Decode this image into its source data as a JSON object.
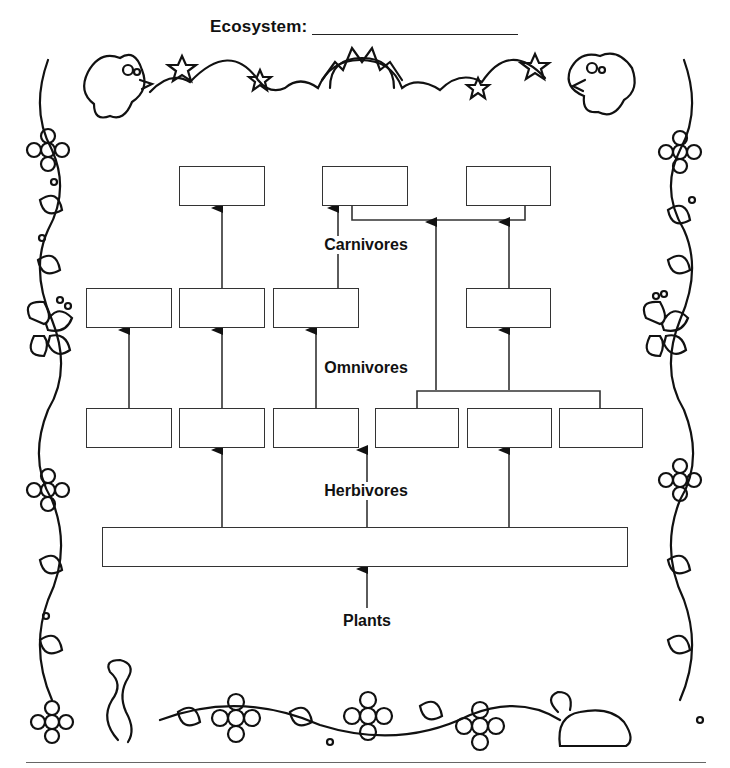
{
  "worksheet": {
    "title": "Ecosystem:",
    "title_blank": "",
    "trophic_labels": {
      "carnivores": "Carnivores",
      "omnivores": "Omnivores",
      "herbivores": "Herbivores",
      "plants": "Plants"
    }
  },
  "diagram": {
    "type": "food-web",
    "levels": [
      {
        "name": "Carnivores",
        "box_count": 3
      },
      {
        "name": "Omnivores",
        "box_count": 4
      },
      {
        "name": "Herbivores",
        "box_count": 6
      },
      {
        "name": "Plants",
        "box_count": 1
      }
    ],
    "boxes": [
      {
        "id": "c1",
        "level": "carnivores",
        "x": 179,
        "y": 166,
        "w": 86,
        "h": 40,
        "value": ""
      },
      {
        "id": "c2",
        "level": "carnivores",
        "x": 322,
        "y": 166,
        "w": 86,
        "h": 40,
        "value": ""
      },
      {
        "id": "c3",
        "level": "carnivores",
        "x": 466,
        "y": 166,
        "w": 85,
        "h": 40,
        "value": ""
      },
      {
        "id": "o1",
        "level": "omnivores",
        "x": 86,
        "y": 288,
        "w": 86,
        "h": 40,
        "value": ""
      },
      {
        "id": "o2",
        "level": "omnivores",
        "x": 179,
        "y": 288,
        "w": 86,
        "h": 40,
        "value": ""
      },
      {
        "id": "o3",
        "level": "omnivores",
        "x": 273,
        "y": 288,
        "w": 86,
        "h": 40,
        "value": ""
      },
      {
        "id": "o4",
        "level": "omnivores",
        "x": 466,
        "y": 288,
        "w": 85,
        "h": 40,
        "value": ""
      },
      {
        "id": "h1",
        "level": "herbivores",
        "x": 86,
        "y": 408,
        "w": 86,
        "h": 40,
        "value": ""
      },
      {
        "id": "h2",
        "level": "herbivores",
        "x": 179,
        "y": 408,
        "w": 86,
        "h": 40,
        "value": ""
      },
      {
        "id": "h3",
        "level": "herbivores",
        "x": 273,
        "y": 408,
        "w": 86,
        "h": 40,
        "value": ""
      },
      {
        "id": "h4",
        "level": "herbivores",
        "x": 375,
        "y": 408,
        "w": 84,
        "h": 40,
        "value": ""
      },
      {
        "id": "h5",
        "level": "herbivores",
        "x": 467,
        "y": 408,
        "w": 85,
        "h": 40,
        "value": ""
      },
      {
        "id": "h6",
        "level": "herbivores",
        "x": 559,
        "y": 408,
        "w": 84,
        "h": 40,
        "value": ""
      },
      {
        "id": "p1",
        "level": "plants",
        "x": 102,
        "y": 527,
        "w": 526,
        "h": 40,
        "value": ""
      }
    ],
    "edges": [
      {
        "from": "o2",
        "to": "c1"
      },
      {
        "from": "o3",
        "to": "c2"
      },
      {
        "from": "h4+h6",
        "to": "c2+c3"
      },
      {
        "from": "o4",
        "to": "c3"
      },
      {
        "from": "h1",
        "to": "o1"
      },
      {
        "from": "h2",
        "to": "o2"
      },
      {
        "from": "h3",
        "to": "o3"
      },
      {
        "from": "h4+h6",
        "to": "o4"
      },
      {
        "from": "p1",
        "to": "h2"
      },
      {
        "from": "p1",
        "to": "h3/h4"
      },
      {
        "from": "p1",
        "to": "h5"
      },
      {
        "from": "plants-label",
        "to": "p1"
      }
    ],
    "colors": {
      "line": "#333333",
      "text": "#111111",
      "background": "#ffffff"
    }
  },
  "border": {
    "style": "cartoon",
    "icons": [
      "bird-icon",
      "star-icon",
      "sun-icon",
      "bird-icon",
      "flower-icon",
      "leaf-icon",
      "butterfly-icon",
      "worm-icon",
      "turtle-icon"
    ]
  }
}
